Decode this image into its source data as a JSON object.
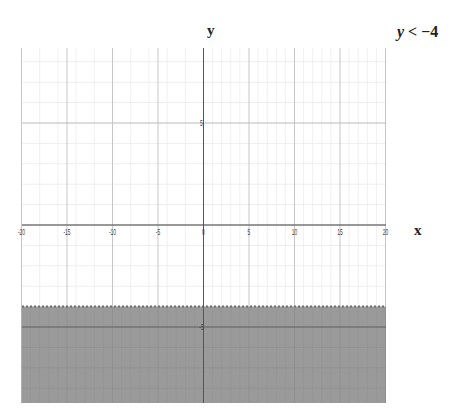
{
  "chart_data": {
    "type": "area",
    "inequality": {
      "variable": "y",
      "operator": "<",
      "value": -4,
      "boundary": "dashed"
    },
    "xlabel": "x",
    "ylabel": "y",
    "xlim": [
      -20,
      20
    ],
    "ylim": [
      -8.5,
      8.5
    ],
    "x_ticks": [
      -20,
      -15,
      -10,
      -5,
      0,
      5,
      10,
      15,
      20
    ],
    "x_tick_labels": [
      "-20",
      "-15",
      "-10",
      "-5",
      "0",
      "5",
      "10",
      "15",
      "20"
    ],
    "y_ticks": [
      5,
      -5
    ],
    "y_tick_labels": [
      "5",
      "-5"
    ],
    "grid": true,
    "shaded_region": {
      "y_from": -8.5,
      "y_to": -4,
      "color": "#9a9a9a"
    }
  },
  "labels": {
    "x_axis": "x",
    "y_axis": "y",
    "title_var": "y",
    "title_rest": " < −4"
  },
  "colors": {
    "grid_minor": "#e6e6e6",
    "grid_major": "#b9b9b9",
    "axis": "#555555",
    "fill": "#9a9a9a",
    "boundary": "#6d6d6d"
  }
}
